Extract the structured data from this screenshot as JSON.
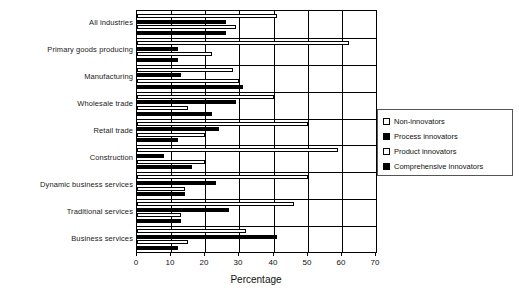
{
  "chart_data": {
    "type": "bar",
    "orientation": "horizontal",
    "title": "",
    "xlabel": "Percentage",
    "ylabel": "",
    "xlim": [
      0,
      70
    ],
    "xticks": [
      0,
      10,
      20,
      30,
      40,
      50,
      60,
      70
    ],
    "grid": true,
    "legend_position": "right",
    "categories": [
      "All industries",
      "Primary goods producing",
      "Manufacturing",
      "Wholesale trade",
      "Retail trade",
      "Construction",
      "Dynamic business services",
      "Traditional services",
      "Business services"
    ],
    "series": [
      {
        "name": "Non-innovators",
        "style": "open",
        "values": [
          41,
          62,
          28,
          40,
          50,
          59,
          50,
          46,
          32
        ]
      },
      {
        "name": "Process innovators",
        "style": "solid",
        "values": [
          26,
          12,
          13,
          29,
          24,
          8,
          23,
          27,
          41
        ]
      },
      {
        "name": "Product innovators",
        "style": "open",
        "values": [
          29,
          22,
          30,
          15,
          20,
          20,
          14,
          13,
          15
        ]
      },
      {
        "name": "Comprehensive innovators",
        "style": "solid",
        "values": [
          26,
          12,
          31,
          22,
          12,
          16,
          14,
          13,
          12
        ]
      }
    ]
  },
  "legend": {
    "items": [
      {
        "label": "Non-innovators",
        "style": "open"
      },
      {
        "label": "Process innovators",
        "style": "solid"
      },
      {
        "label": "Product innovators",
        "style": "open"
      },
      {
        "label": "Comprehensive innovators",
        "style": "solid"
      }
    ]
  },
  "axis": {
    "x_label": "Percentage",
    "tick_labels": [
      "0",
      "10",
      "20",
      "30",
      "40",
      "50",
      "60",
      "70"
    ]
  }
}
